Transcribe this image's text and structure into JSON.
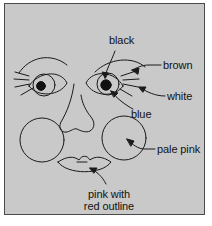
{
  "figure": {
    "panel": {
      "background_color": "#c9c9c9",
      "border_color": "#4a4a4a",
      "outer_background_color": "#ffffff"
    },
    "line_color": "#1a1a1a",
    "text_color": "#111111"
  },
  "labels": {
    "black": "black",
    "brown": "brown",
    "white": "white",
    "blue": "blue",
    "pale_pink": "pale pink",
    "pink_with_red_outline_line1": "pink with",
    "pink_with_red_outline_line2": "red outline"
  },
  "parts": {
    "left_eye": "left-eye",
    "right_eye": "right-eye",
    "left_eyebrow": "left-eyebrow",
    "right_eyebrow": "right-eyebrow",
    "nose": "nose",
    "left_cheek": "left-cheek-circle",
    "right_cheek": "right-cheek-circle",
    "lips": "lips",
    "left_eyelashes": "left-eyelashes",
    "right_eyelashes": "right-eyelashes",
    "left_pupil": "left-pupil",
    "right_pupil": "right-pupil",
    "left_iris": "left-iris",
    "right_iris": "right-iris"
  },
  "annotations": [
    {
      "name": "black",
      "target": "right-pupil"
    },
    {
      "name": "brown",
      "target": "right-eyebrow"
    },
    {
      "name": "white",
      "target": "right-eye-white"
    },
    {
      "name": "blue",
      "target": "right-iris"
    },
    {
      "name": "pale pink",
      "target": "right-cheek-circle"
    },
    {
      "name": "pink with red outline",
      "target": "lips"
    }
  ]
}
